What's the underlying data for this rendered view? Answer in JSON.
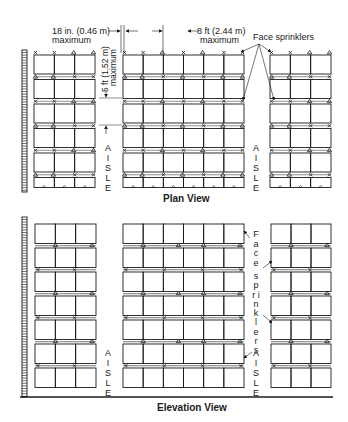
{
  "plan_view": {
    "title": "Plan View",
    "dim_horizontal_left": {
      "value": "18 in. (0.46 m)",
      "qualifier": "maximum"
    },
    "dim_horizontal_right": {
      "value": "8 ft (2.44 m)",
      "qualifier": "maximum"
    },
    "dim_vertical": {
      "value": "5 ft (1.52 m)",
      "qualifier": "maximum"
    },
    "callout": "Face sprinklers",
    "aisle_left": "AISLE",
    "aisle_right": "AISLE",
    "racks": [
      {
        "name": "left-rack",
        "columns": 3,
        "rows": 6
      },
      {
        "name": "middle-rack",
        "columns": 6,
        "rows": 6
      },
      {
        "name": "right-rack",
        "columns": 3,
        "rows": 6
      }
    ],
    "legend_symbols": {
      "x": "sprinkler-x-symbol",
      "triangle": "sprinkler-triangle-symbol"
    }
  },
  "elevation_view": {
    "title": "Elevation View",
    "callout": "Face sprinklers",
    "aisle_left": "AISLE",
    "aisle_right": "AISLE",
    "racks": [
      {
        "name": "left-rack",
        "columns": 3,
        "tiers": 7
      },
      {
        "name": "middle-rack",
        "columns": 6,
        "tiers": 7
      },
      {
        "name": "right-rack",
        "columns": 3,
        "tiers": 7
      }
    ]
  },
  "colors": {
    "line": "#1a1a1a",
    "background": "#ffffff"
  }
}
